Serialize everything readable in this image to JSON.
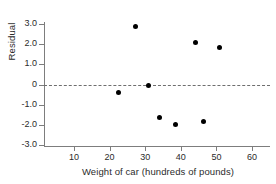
{
  "chart_data": {
    "type": "scatter",
    "title": "",
    "xlabel": "Weight of car (hundreds of pounds)",
    "ylabel": "Residual",
    "xlim": [
      3,
      64
    ],
    "ylim": [
      -3.0,
      3.3
    ],
    "xticks": [
      10,
      20,
      30,
      40,
      50,
      60
    ],
    "xtick_labels": [
      "10",
      "20",
      "30",
      "40",
      "50",
      "60"
    ],
    "yticks": [
      3.0,
      2.0,
      1.0,
      0,
      -1.0,
      -2.0,
      -3.0
    ],
    "ytick_labels": [
      "3.0",
      "2.0",
      "1.0",
      "0",
      "-1.0",
      "-2.0",
      "-3.0"
    ],
    "grid": false,
    "legend": "none",
    "reference_line": {
      "orientation": "horizontal",
      "y": 0,
      "style": "dashed"
    },
    "x": [
      22.4,
      27.2,
      30.8,
      34.0,
      38.4,
      44.0,
      46.3,
      50.8
    ],
    "y": [
      -0.37,
      2.89,
      -0.07,
      -1.61,
      -1.96,
      2.1,
      -1.81,
      1.86
    ],
    "points": [
      {
        "x": 22.4,
        "y": -0.37
      },
      {
        "x": 27.2,
        "y": 2.89
      },
      {
        "x": 30.8,
        "y": -0.07
      },
      {
        "x": 34.0,
        "y": -1.61
      },
      {
        "x": 38.4,
        "y": -1.96
      },
      {
        "x": 44.0,
        "y": 2.1
      },
      {
        "x": 46.3,
        "y": -1.81
      },
      {
        "x": 50.8,
        "y": 1.86
      }
    ],
    "marker": {
      "shape": "circle",
      "color": "#000000",
      "size": 5
    },
    "axis_color": "#7d7d7d"
  }
}
